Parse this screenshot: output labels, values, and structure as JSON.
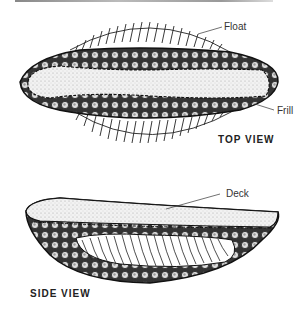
{
  "figure": {
    "top_view": {
      "caption": "TOP VIEW",
      "labels": {
        "float": "Float",
        "frill": "Frill"
      }
    },
    "side_view": {
      "caption": "SIDE VIEW",
      "labels": {
        "deck": "Deck"
      }
    }
  },
  "colors": {
    "ink": "#222222",
    "stipple": "#e6e6e6",
    "background": "#ffffff"
  }
}
